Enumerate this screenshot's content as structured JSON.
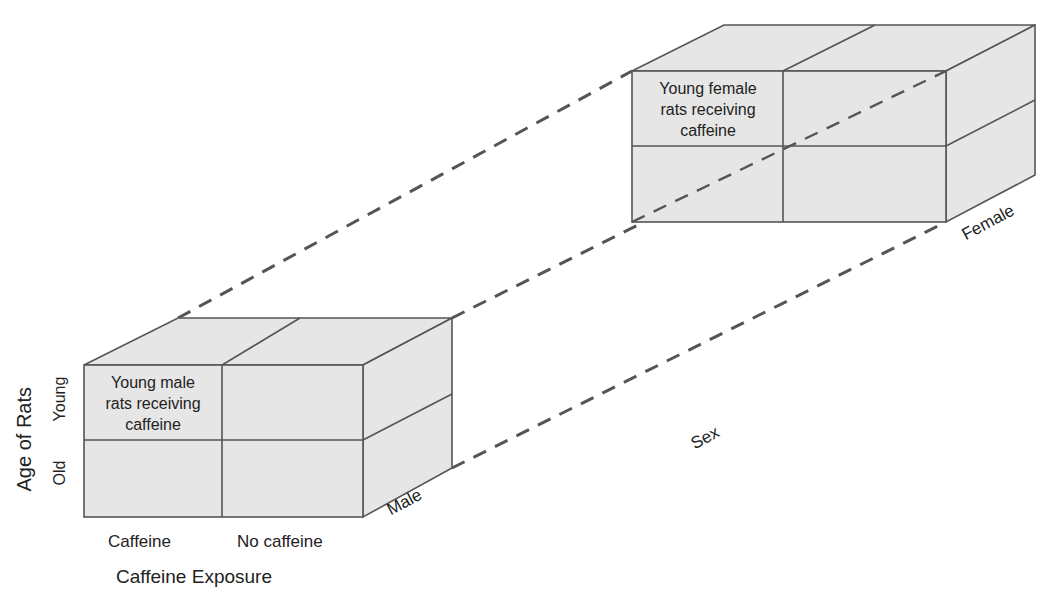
{
  "diagram": {
    "type": "factorial-design-cube",
    "factors": {
      "caffeine_exposure": {
        "title": "Caffeine Exposure",
        "levels": [
          "Caffeine",
          "No caffeine"
        ]
      },
      "age_of_rats": {
        "title": "Age of Rats",
        "levels": [
          "Young",
          "Old"
        ]
      },
      "sex": {
        "title": "Sex",
        "levels": [
          "Male",
          "Female"
        ]
      }
    },
    "cells": {
      "male_young_caffeine": "Young male rats receiving caffeine",
      "female_young_caffeine": "Young female rats receiving caffeine"
    },
    "colors": {
      "face": "#e6e6e6",
      "line": "#555555",
      "text": "#222222"
    }
  },
  "labels": {
    "male_cell_line1": "Young male",
    "male_cell_line2": "rats receiving",
    "male_cell_line3": "caffeine",
    "female_cell_line1": "Young female",
    "female_cell_line2": "rats receiving",
    "female_cell_line3": "caffeine",
    "col_caffeine": "Caffeine",
    "col_no_caffeine": "No caffeine",
    "x_axis_title": "Caffeine Exposure",
    "y_axis_title": "Age of Rats",
    "row_young": "Young",
    "row_old": "Old",
    "sex_male": "Male",
    "sex_female": "Female",
    "z_axis_title": "Sex"
  }
}
